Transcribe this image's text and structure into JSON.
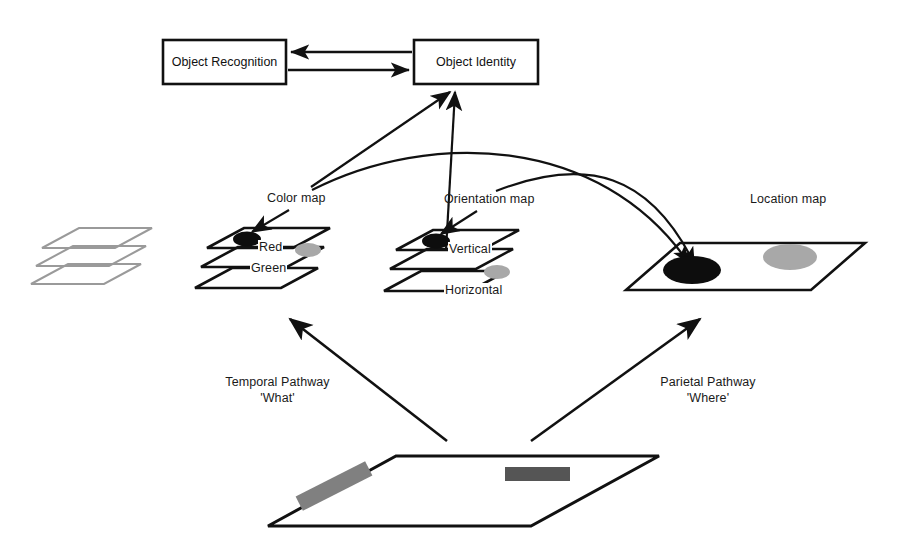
{
  "figure": {
    "background_color": "#ffffff",
    "line_color": "#111111",
    "faint_plane_color": "#9a9a9a",
    "blob_dark_color": "#0d0d0d",
    "blob_gray_color": "#a8a8a8",
    "bar_light_gray": "#808080",
    "bar_dark_gray": "#555555"
  },
  "boxes": {
    "object_recognition": {
      "label": "Object Recognition"
    },
    "object_identity": {
      "label": "Object Identity"
    }
  },
  "maps": {
    "color_map": {
      "title": "Color map",
      "layers": [
        {
          "label": "Red"
        },
        {
          "label": "Green"
        },
        {
          "label": ""
        }
      ]
    },
    "orientation_map": {
      "title": "Orientation map",
      "layers": [
        {
          "label": "Vertical"
        },
        {
          "label": ""
        },
        {
          "label": "Horizontal"
        }
      ]
    },
    "location_map": {
      "title": "Location map"
    },
    "input_stack": {
      "title": ""
    },
    "input_plane": {
      "title": ""
    }
  },
  "pathways": {
    "temporal": {
      "line1": "Temporal Pathway",
      "line2": "'What'"
    },
    "parietal": {
      "line1": "Parietal Pathway",
      "line2": "'Where'"
    }
  }
}
